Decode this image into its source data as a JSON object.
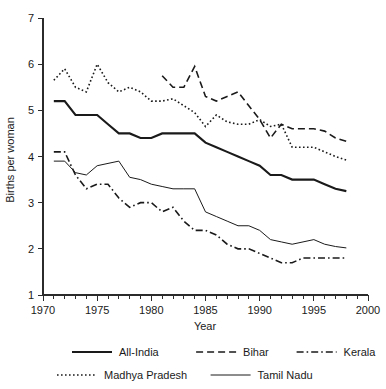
{
  "chart_data": {
    "type": "line",
    "title": "",
    "xlabel": "Year",
    "ylabel": "Births per woman",
    "xlim": [
      1970,
      2000
    ],
    "ylim": [
      1,
      7
    ],
    "xticks": [
      1970,
      1975,
      1980,
      1985,
      1990,
      1995,
      2000
    ],
    "xtick_labels": [
      "1970",
      "1975",
      "1980",
      "1985",
      "1990",
      "1995",
      "2000"
    ],
    "yticks": [
      1,
      2,
      3,
      4,
      5,
      6,
      7
    ],
    "ytick_labels": [
      "1",
      "2",
      "3",
      "4",
      "5",
      "6",
      "7"
    ],
    "minor_xtick_interval": 1,
    "grid": false,
    "legend_position": "below-axes",
    "series": [
      {
        "name": "All-India",
        "style": "solid-thick",
        "x": [
          1971,
          1972,
          1973,
          1974,
          1975,
          1976,
          1977,
          1978,
          1979,
          1980,
          1981,
          1982,
          1983,
          1984,
          1985,
          1986,
          1987,
          1988,
          1989,
          1990,
          1991,
          1992,
          1993,
          1994,
          1995,
          1996,
          1997,
          1998
        ],
        "values": [
          5.2,
          5.2,
          4.9,
          4.9,
          4.9,
          4.7,
          4.5,
          4.5,
          4.4,
          4.4,
          4.5,
          4.5,
          4.5,
          4.5,
          4.3,
          4.2,
          4.1,
          4.0,
          3.9,
          3.8,
          3.6,
          3.6,
          3.5,
          3.5,
          3.5,
          3.4,
          3.3,
          3.25
        ]
      },
      {
        "name": "Bihar",
        "style": "dashed",
        "x": [
          1981,
          1982,
          1983,
          1984,
          1985,
          1986,
          1987,
          1988,
          1989,
          1990,
          1991,
          1992,
          1993,
          1994,
          1995,
          1996,
          1997,
          1998
        ],
        "values": [
          5.75,
          5.5,
          5.5,
          5.95,
          5.3,
          5.2,
          5.3,
          5.4,
          5.1,
          4.8,
          4.4,
          4.7,
          4.6,
          4.6,
          4.6,
          4.55,
          4.4,
          4.33
        ]
      },
      {
        "name": "Kerala",
        "style": "dash-dot",
        "x": [
          1971,
          1972,
          1973,
          1974,
          1975,
          1976,
          1977,
          1978,
          1979,
          1980,
          1981,
          1982,
          1983,
          1984,
          1985,
          1986,
          1987,
          1988,
          1989,
          1990,
          1991,
          1992,
          1993,
          1994,
          1995,
          1996,
          1997,
          1998
        ],
        "values": [
          4.1,
          4.1,
          3.6,
          3.3,
          3.4,
          3.4,
          3.1,
          2.9,
          3.0,
          3.0,
          2.8,
          2.9,
          2.6,
          2.4,
          2.4,
          2.3,
          2.1,
          2.0,
          2.0,
          1.9,
          1.8,
          1.7,
          1.7,
          1.8,
          1.8,
          1.8,
          1.8,
          1.8
        ]
      },
      {
        "name": "Madhya Pradesh",
        "style": "dotted",
        "x": [
          1971,
          1972,
          1973,
          1974,
          1975,
          1976,
          1977,
          1978,
          1979,
          1980,
          1981,
          1982,
          1983,
          1984,
          1985,
          1986,
          1987,
          1988,
          1989,
          1990,
          1991,
          1992,
          1993,
          1994,
          1995,
          1996,
          1997,
          1998
        ],
        "values": [
          5.65,
          5.9,
          5.5,
          5.4,
          6.0,
          5.6,
          5.4,
          5.5,
          5.4,
          5.2,
          5.2,
          5.25,
          5.1,
          4.95,
          4.65,
          4.9,
          4.75,
          4.7,
          4.7,
          4.8,
          4.65,
          4.7,
          4.2,
          4.2,
          4.2,
          4.1,
          4.0,
          3.92
        ]
      },
      {
        "name": "Tamil Nadu",
        "style": "solid-thin",
        "x": [
          1971,
          1972,
          1973,
          1974,
          1975,
          1976,
          1977,
          1978,
          1979,
          1980,
          1981,
          1982,
          1983,
          1984,
          1985,
          1986,
          1987,
          1988,
          1989,
          1990,
          1991,
          1992,
          1993,
          1994,
          1995,
          1996,
          1997,
          1998
        ],
        "values": [
          3.9,
          3.9,
          3.65,
          3.6,
          3.8,
          3.85,
          3.9,
          3.55,
          3.5,
          3.4,
          3.35,
          3.3,
          3.3,
          3.3,
          2.8,
          2.7,
          2.6,
          2.5,
          2.5,
          2.4,
          2.2,
          2.15,
          2.1,
          2.15,
          2.2,
          2.1,
          2.05,
          2.02
        ]
      }
    ]
  },
  "legend": {
    "entries": [
      {
        "label": "All-India",
        "style": "solid-thick"
      },
      {
        "label": "Bihar",
        "style": "dashed"
      },
      {
        "label": "Kerala",
        "style": "dash-dot"
      },
      {
        "label": "Madhya Pradesh",
        "style": "dotted"
      },
      {
        "label": "Tamil Nadu",
        "style": "solid-thin"
      }
    ]
  },
  "colors": {
    "ink": "#1a1a1a",
    "axis": "#2b2b2b",
    "background": "#ffffff"
  }
}
